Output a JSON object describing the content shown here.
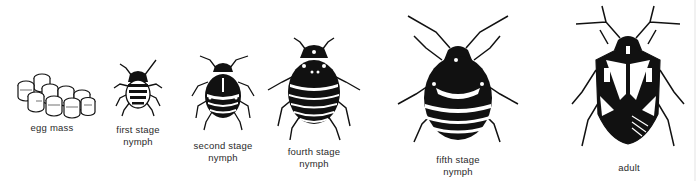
{
  "figure": {
    "stages": [
      {
        "id": "egg-mass",
        "line1": "egg mass",
        "line2": ""
      },
      {
        "id": "first-stage-nymph",
        "line1": "first stage",
        "line2": "nymph"
      },
      {
        "id": "second-stage-nymph",
        "line1": "second stage",
        "line2": "nymph"
      },
      {
        "id": "fourth-stage-nymph",
        "line1": "fourth stage",
        "line2": "nymph"
      },
      {
        "id": "fifth-stage-nymph",
        "line1": "fifth stage",
        "line2": "nymph"
      },
      {
        "id": "adult",
        "line1": "adult",
        "line2": ""
      }
    ]
  },
  "colors": {
    "ink": "#111111",
    "paper": "#ffffff",
    "label": "#2a2a2a"
  }
}
